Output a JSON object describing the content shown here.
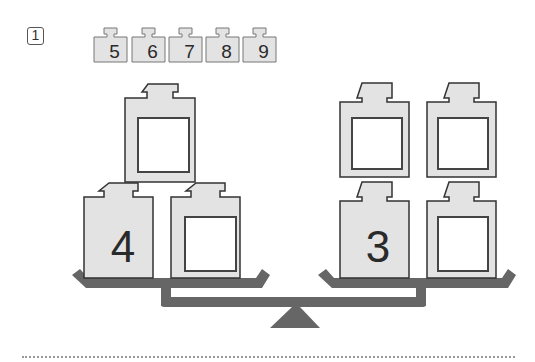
{
  "question": {
    "number": "1"
  },
  "available_weights": [
    {
      "label": "5",
      "x": 100
    },
    {
      "label": "6",
      "x": 138
    },
    {
      "label": "7",
      "x": 175
    },
    {
      "label": "8",
      "x": 212
    },
    {
      "label": "9",
      "x": 249
    }
  ],
  "left_pan": {
    "weights": [
      {
        "id": "left-bottom-1",
        "value": "4",
        "filled": true
      },
      {
        "id": "left-bottom-2",
        "value": "",
        "filled": false
      },
      {
        "id": "left-top",
        "value": "",
        "filled": false
      }
    ]
  },
  "right_pan": {
    "weights": [
      {
        "id": "right-bottom-1",
        "value": "3",
        "filled": true
      },
      {
        "id": "right-bottom-2",
        "value": "",
        "filled": false
      },
      {
        "id": "right-top-1",
        "value": "",
        "filled": false
      },
      {
        "id": "right-top-2",
        "value": "",
        "filled": false
      }
    ]
  },
  "colors": {
    "weight_fill": "#e3e3e3",
    "weight_stroke": "#3a3a3a",
    "scale": "#666666",
    "slot_fill": "#ffffff"
  }
}
